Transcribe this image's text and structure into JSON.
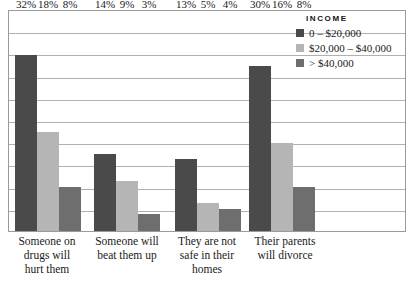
{
  "legend": {
    "title": "INCOME",
    "entries": [
      {
        "label": "0 – $20,000",
        "color": "#4a4a4a",
        "swatch_name": "legend-swatch-low-income"
      },
      {
        "label": "$20,000 – $40,000",
        "color": "#b5b5b5",
        "swatch_name": "legend-swatch-mid-income"
      },
      {
        "label": "> $40,000",
        "color": "#6e6e6e",
        "swatch_name": "legend-swatch-high-income"
      }
    ]
  },
  "chart_data": {
    "type": "bar",
    "title": "",
    "xlabel": "",
    "ylabel": "",
    "ylim": [
      0,
      40
    ],
    "grid": true,
    "legend_position": "top-right",
    "categories": [
      "Someone on drugs will hurt them",
      "Someone will beat them up",
      "They are not safe in their homes",
      "Their parents will divorce"
    ],
    "category_lines": [
      [
        "Someone on",
        "drugs will",
        "hurt them"
      ],
      [
        "Someone will",
        "beat them up"
      ],
      [
        "They are not",
        "safe in their",
        "homes"
      ],
      [
        "Their parents",
        "will divorce"
      ]
    ],
    "series": [
      {
        "name": "0 – $20,000",
        "color": "#4a4a4a",
        "values": [
          32,
          14,
          13,
          30
        ],
        "labels": [
          "32%",
          "14%",
          "13%",
          "30%"
        ]
      },
      {
        "name": "$20,000 – $40,000",
        "color": "#b5b5b5",
        "values": [
          18,
          9,
          5,
          16
        ],
        "labels": [
          "18%",
          "9%",
          "5%",
          "16%"
        ]
      },
      {
        "name": "> $40,000",
        "color": "#6e6e6e",
        "values": [
          8,
          3,
          4,
          8
        ],
        "labels": [
          "8%",
          "3%",
          "4%",
          "8%"
        ]
      }
    ],
    "gridline_count": 9
  }
}
